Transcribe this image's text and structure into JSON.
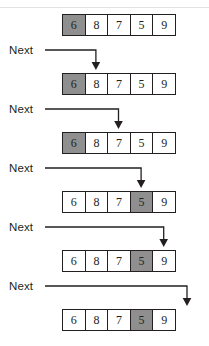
{
  "figure": {
    "title_rule": true,
    "array_values": [
      "6",
      "8",
      "7",
      "5",
      "9"
    ],
    "cell_count": 5,
    "label_text": "Next",
    "colors": {
      "highlight": "#8f8f8f",
      "cell_border": "#231f20",
      "cell_fill": "#ffffff",
      "line": "#231f20",
      "text": "#231f20",
      "rule": "#e2e2e2"
    }
  },
  "steps": [
    {
      "id": "step-1",
      "label": "",
      "has_pointer": false,
      "highlight_index": 0,
      "pointer_index": null,
      "values": [
        "6",
        "8",
        "7",
        "5",
        "9"
      ]
    },
    {
      "id": "step-2",
      "label": "Next",
      "has_pointer": true,
      "highlight_index": 0,
      "pointer_index": 1,
      "values": [
        "6",
        "8",
        "7",
        "5",
        "9"
      ]
    },
    {
      "id": "step-3",
      "label": "Next",
      "has_pointer": true,
      "highlight_index": 0,
      "pointer_index": 2,
      "values": [
        "6",
        "8",
        "7",
        "5",
        "9"
      ]
    },
    {
      "id": "step-4",
      "label": "Next",
      "has_pointer": true,
      "highlight_index": 3,
      "pointer_index": 3,
      "values": [
        "6",
        "8",
        "7",
        "5",
        "9"
      ]
    },
    {
      "id": "step-5",
      "label": "Next",
      "has_pointer": true,
      "highlight_index": 3,
      "pointer_index": 4,
      "values": [
        "6",
        "8",
        "7",
        "5",
        "9"
      ]
    },
    {
      "id": "step-6",
      "label": "Next",
      "has_pointer": true,
      "highlight_index": 3,
      "pointer_index": 5,
      "values": [
        "6",
        "8",
        "7",
        "5",
        "9"
      ]
    }
  ]
}
